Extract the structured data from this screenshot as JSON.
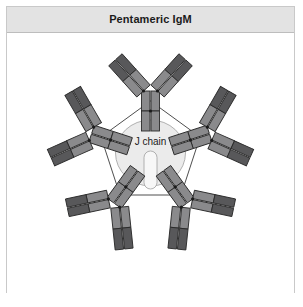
{
  "panel": {
    "title": "Pentameric IgM",
    "background_color": "#ffffff",
    "header_color": "#e3e3e3",
    "border_color": "#c9c9c9"
  },
  "diagram": {
    "name": "pentameric-igm-diagram",
    "center_label": "J chain",
    "monomer_count": 5,
    "colors": {
      "fab_tip_dark": "#58585a",
      "segment_mid": "#8a8a8c",
      "segment_light": "#9a9a9c",
      "outline": "#2b2b2b",
      "separator": "#ffffff",
      "jchain_disc": "#ebebeb",
      "jchain_capsule": "#f7f7f7",
      "link_line": "#3a3a3a"
    },
    "structure": {
      "center_x": 143.5,
      "center_y": 120,
      "jchain_rx": 35,
      "jchain_ry": 33,
      "pentagon_radius": 52,
      "monomer_angles_deg": [
        270,
        342,
        54,
        126,
        198
      ]
    }
  }
}
